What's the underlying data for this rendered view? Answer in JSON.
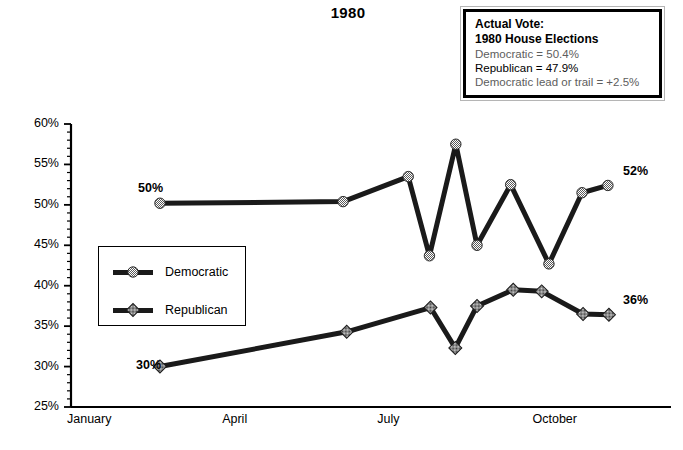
{
  "chart_title": "1980",
  "callout": {
    "name": "actual-vote-callout",
    "line1": "Actual Vote:",
    "line2": "1980 House Elections",
    "line3": "Democratic = 50.4%",
    "line4": "Republican = 47.9%",
    "line5": "Democratic lead or trail = +2.5%"
  },
  "legend": {
    "items": [
      {
        "label": "Democratic",
        "marker": "checkered-circle-marker",
        "color": "#1a1a1a"
      },
      {
        "label": "Republican",
        "marker": "checkered-diamond-marker",
        "color": "#1a1a1a"
      }
    ]
  },
  "annotations": [
    {
      "name": "democratic-start-label",
      "text": "50%",
      "x": 138,
      "y": 181
    },
    {
      "name": "democratic-end-label",
      "text": "52%",
      "x": 623,
      "y": 164
    },
    {
      "name": "republican-start-label",
      "text": "30%",
      "x": 136,
      "y": 358
    },
    {
      "name": "republican-end-label",
      "text": "36%",
      "x": 623,
      "y": 293
    }
  ],
  "chart_data": {
    "type": "line",
    "title": "1980",
    "xlabel": "",
    "ylabel": "",
    "ylim": [
      25,
      60
    ],
    "ytick_labels": [
      "25%",
      "30%",
      "35%",
      "40%",
      "45%",
      "50%",
      "55%",
      "60%"
    ],
    "ytick_values": [
      25,
      30,
      35,
      40,
      45,
      50,
      55,
      60
    ],
    "yminor_step": 1,
    "xtick_labels": [
      "January",
      "April",
      "July",
      "October"
    ],
    "xtick_positions": [
      0,
      3,
      6,
      9
    ],
    "xlim": [
      0,
      11.6
    ],
    "grid": false,
    "legend_position": "inside-left",
    "series": [
      {
        "name": "Democratic",
        "color": "#1a1a1a",
        "marker": "checkered-circle-marker",
        "x": [
          1.72,
          5.26,
          6.52,
          6.93,
          7.44,
          7.85,
          8.5,
          9.24,
          9.88,
          10.38
        ],
        "values": [
          50.2,
          50.4,
          53.5,
          43.7,
          57.5,
          45.0,
          52.5,
          42.7,
          51.5,
          52.4
        ]
      },
      {
        "name": "Republican",
        "color": "#1a1a1a",
        "marker": "checkered-diamond-marker",
        "x": [
          1.72,
          5.33,
          6.95,
          7.43,
          7.85,
          8.55,
          9.1,
          9.9,
          10.4
        ],
        "values": [
          30.0,
          34.3,
          37.3,
          32.3,
          37.5,
          39.5,
          39.3,
          36.5,
          36.4
        ]
      }
    ]
  }
}
